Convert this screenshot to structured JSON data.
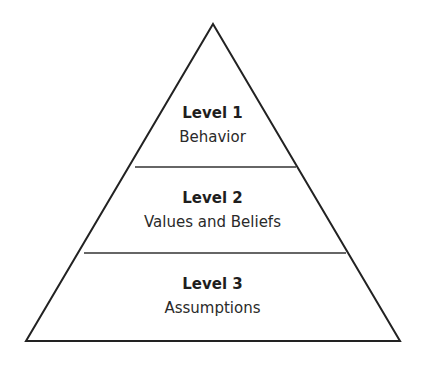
{
  "diagram": {
    "type": "pyramid",
    "levels": [
      {
        "title": "Level 1",
        "description": "Behavior"
      },
      {
        "title": "Level 2",
        "description": "Values and Beliefs"
      },
      {
        "title": "Level 3",
        "description": "Assumptions"
      }
    ],
    "colors": {
      "stroke": "#222222",
      "fill": "#ffffff"
    }
  }
}
